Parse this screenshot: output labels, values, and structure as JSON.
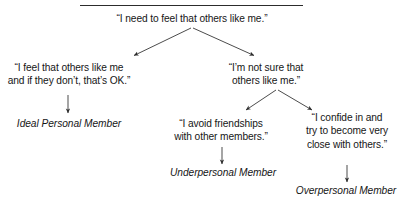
{
  "figure": {
    "type": "flowchart-tree",
    "divider": "horizontal-rule",
    "accent_color": "#2c2c2c",
    "text_color": "#161616"
  },
  "nodes": {
    "root": {
      "id": "root-need",
      "text": "“I need to feel that others like me.”",
      "style": "quote"
    },
    "left_branch": {
      "id": "secure-response",
      "text": "“I feel that others like me\nand if they don’t, that’s OK.”",
      "style": "quote"
    },
    "right_branch": {
      "id": "insecure-response",
      "text": "“I’m not sure that\nothers like me.”",
      "style": "quote"
    },
    "middle_quote": {
      "id": "avoidance-response",
      "text": "“I avoid friendships\nwith other members.”",
      "style": "quote"
    },
    "far_right_quote": {
      "id": "overdisclosure-response",
      "text": "“I confide in and\ntry to become very\nclose with others.”",
      "style": "quote"
    }
  },
  "outcomes": {
    "ideal": {
      "id": "ideal-personal-member",
      "text": "Ideal Personal Member",
      "style": "italic"
    },
    "under": {
      "id": "underpersonal-member",
      "text": "Underpersonal Member",
      "style": "italic"
    },
    "over": {
      "id": "overpersonal-member",
      "text": "Overpersonal Member",
      "style": "italic"
    }
  },
  "connectors": [
    {
      "id": "root-to-left",
      "kind": "diagonal-arrow",
      "from": "root",
      "to": "left_branch"
    },
    {
      "id": "root-to-right",
      "kind": "diagonal-arrow",
      "from": "root",
      "to": "right_branch"
    },
    {
      "id": "left-to-ideal",
      "kind": "vertical-arrow",
      "from": "left_branch",
      "to": "ideal"
    },
    {
      "id": "right-to-mid",
      "kind": "diagonal-arrow",
      "from": "right_branch",
      "to": "middle_quote"
    },
    {
      "id": "right-to-far",
      "kind": "diagonal-arrow",
      "from": "right_branch",
      "to": "far_right_quote"
    },
    {
      "id": "mid-to-under",
      "kind": "vertical-arrow",
      "from": "middle_quote",
      "to": "under"
    },
    {
      "id": "far-to-over",
      "kind": "vertical-arrow",
      "from": "far_right_quote",
      "to": "over"
    }
  ]
}
